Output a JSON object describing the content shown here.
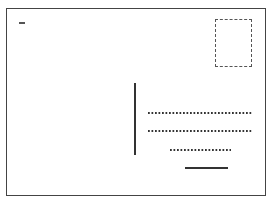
{
  "figure": {
    "elements": {
      "corner_mark": "short dash",
      "stamp_area": "dashed rectangle",
      "divider": "vertical line",
      "address_lines": [
        {
          "style": "dotted"
        },
        {
          "style": "dotted"
        },
        {
          "style": "dotted"
        },
        {
          "style": "solid"
        }
      ]
    },
    "colors": {
      "border": "#444444",
      "ink": "#333333",
      "background": "#ffffff"
    }
  }
}
